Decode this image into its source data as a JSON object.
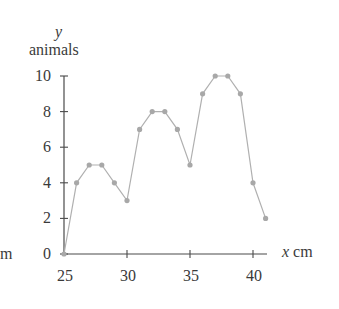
{
  "chart_data": {
    "type": "line",
    "title": "",
    "xlabel": "x cm",
    "ylabel": "y animals",
    "ylabel_var": "y",
    "ylabel_unit": "animals",
    "xlabel_var": "x",
    "xlabel_unit": "cm",
    "left_edge_text": "m",
    "x": [
      25,
      26,
      27,
      28,
      29,
      30,
      31,
      32,
      33,
      34,
      35,
      36,
      37,
      38,
      39,
      40,
      41
    ],
    "values": [
      0,
      4,
      5,
      5,
      4,
      3,
      7,
      8,
      8,
      7,
      5,
      9,
      10,
      10,
      9,
      4,
      2
    ],
    "xlim": [
      25,
      41
    ],
    "ylim": [
      0,
      10
    ],
    "xticks": [
      25,
      30,
      35,
      40
    ],
    "yticks": [
      0,
      2,
      4,
      6,
      8,
      10
    ],
    "xtick_labels": [
      "25",
      "30",
      "35",
      "40"
    ],
    "ytick_labels": [
      "0",
      "2",
      "4",
      "6",
      "8",
      "10"
    ],
    "grid": false,
    "legend": null,
    "markers": true,
    "colors": {
      "line": "#b0b0b0",
      "marker": "#a8a8a8",
      "axis": "#4a4a4a",
      "text": "#3a3a3a"
    }
  }
}
